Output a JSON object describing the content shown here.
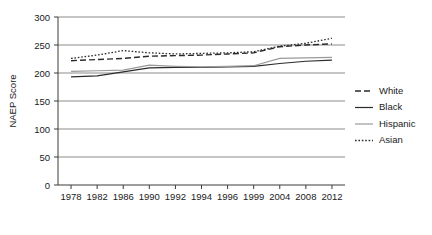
{
  "chart_data": {
    "type": "line",
    "title": "",
    "xlabel": "",
    "ylabel": "NAEP Score",
    "ylim": [
      0,
      300
    ],
    "yticks": [
      0,
      50,
      100,
      150,
      200,
      250,
      300
    ],
    "ytick_labels": [
      "0",
      "50",
      "100",
      "150",
      "200",
      "250",
      "300"
    ],
    "grid": true,
    "legend_position": "right",
    "categories": [
      "1978",
      "1982",
      "1986",
      "1990",
      "1992",
      "1994",
      "1996",
      "1999",
      "2004",
      "2008",
      "2012"
    ],
    "series": [
      {
        "name": "White",
        "style": "dashed",
        "color": "#2b2b2b",
        "values": [
          222,
          224,
          226,
          230,
          231,
          232,
          234,
          236,
          247,
          250,
          252
        ]
      },
      {
        "name": "Black",
        "style": "solid",
        "color": "#2b2b2b",
        "values": [
          193,
          195,
          202,
          209,
          210,
          210,
          211,
          212,
          217,
          221,
          223
        ]
      },
      {
        "name": "Hispanic",
        "style": "solid",
        "color": "#9a9a9a",
        "values": [
          203,
          204,
          205,
          214,
          212,
          211,
          212,
          213,
          226,
          227,
          228
        ]
      },
      {
        "name": "Asian",
        "style": "dotted",
        "color": "#2b2b2b",
        "values": [
          226,
          232,
          240,
          236,
          234,
          235,
          236,
          238,
          248,
          253,
          262
        ]
      }
    ]
  },
  "legend": {
    "items": [
      {
        "label": "White"
      },
      {
        "label": "Black"
      },
      {
        "label": "Hispanic"
      },
      {
        "label": "Asian"
      }
    ]
  }
}
